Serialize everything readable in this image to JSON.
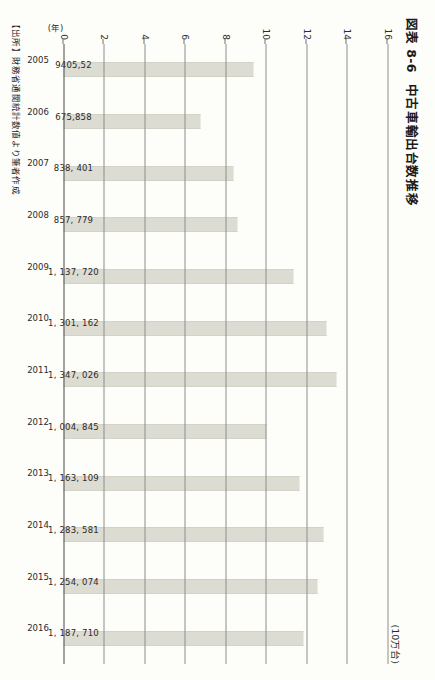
{
  "figure": {
    "number": "図表 8-6",
    "title": "中古車輸出台数推移",
    "unit_label": "(10万台)",
    "category_axis_caption": "(年)",
    "source_note": "【出所】財務省通関統計数値より筆者作成"
  },
  "colors": {
    "bar_fill": "#dcdcd2",
    "gridline": "#8e8e8e",
    "axis": "#4a4a4a",
    "text": "#1a1a1a",
    "page_background": "#fdfdfa"
  },
  "chart_data": {
    "type": "bar",
    "title": "中古車輸出台数推移",
    "xlabel": "(年)",
    "ylabel": "(10万台)",
    "ylim": [
      0,
      16
    ],
    "yticks": [
      0,
      2,
      4,
      6,
      8,
      10,
      12,
      14,
      16
    ],
    "grid": true,
    "legend": "none",
    "orientation": "vertical-bars-on-rotated-page",
    "categories": [
      "2005",
      "2006",
      "2007",
      "2008",
      "2009",
      "2010",
      "2011",
      "2012",
      "2013",
      "2014",
      "2015",
      "2016"
    ],
    "values": [
      9.4055,
      6.75858,
      8.38401,
      8.57779,
      11.3772,
      13.01162,
      13.47026,
      10.04845,
      11.63109,
      12.83581,
      12.54074,
      11.8771
    ],
    "data_labels": [
      "9405,52",
      "675,858",
      "838, 401",
      "857, 779",
      "1, 137, 720",
      "1, 301, 162",
      "1, 347, 026",
      "1, 004, 845",
      "1, 163, 109",
      "1, 283, 581",
      "1, 254, 074",
      "1, 187, 710"
    ],
    "series": [
      {
        "name": "中古車輸出台数",
        "values": [
          9.4055,
          6.75858,
          8.38401,
          8.57779,
          11.3772,
          13.01162,
          13.47026,
          10.04845,
          11.63109,
          12.83581,
          12.54074,
          11.8771
        ]
      }
    ]
  }
}
